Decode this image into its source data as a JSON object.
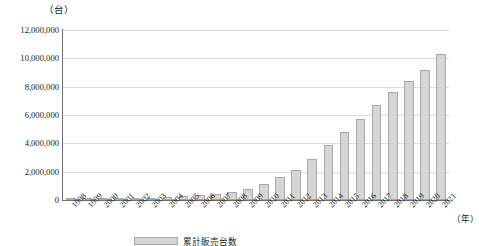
{
  "chart_data": {
    "type": "bar",
    "title": "",
    "subtitle": "",
    "unit_label": "（台）",
    "xlabel": "（年）",
    "ylabel": "",
    "ylim": [
      0,
      12000000
    ],
    "ytick_step": 2000000,
    "grid": true,
    "legend_position": "bottom",
    "categories": [
      "1998",
      "1999",
      "2000",
      "2001",
      "2002",
      "2003",
      "2004",
      "2005",
      "2006",
      "2007",
      "2008",
      "2009",
      "2010",
      "2011",
      "2012",
      "2013",
      "2014",
      "2015",
      "2016",
      "2017",
      "2018",
      "2019",
      "2020",
      "2021"
    ],
    "ytick_labels": [
      "0",
      "2,000,000",
      "4,000,000",
      "6,000,000",
      "8,000,000",
      "10,000,000",
      "12,000,000"
    ],
    "ytick_values": [
      0,
      2000000,
      4000000,
      6000000,
      8000000,
      10000000,
      12000000
    ],
    "series": [
      {
        "name": "累計販売台数",
        "color": "#d6d6d6",
        "values": [
          60000,
          70000,
          90000,
          110000,
          130000,
          160000,
          200000,
          260000,
          330000,
          420000,
          560000,
          780000,
          1100000,
          1600000,
          2100000,
          2900000,
          3900000,
          4800000,
          5700000,
          6700000,
          7600000,
          8400000,
          9200000,
          10300000
        ]
      }
    ],
    "legend": [
      {
        "label": "累計販売台数",
        "color": "#d6d6d6"
      }
    ]
  },
  "style": {
    "bar_fill": "#d6d6d6",
    "bar_border": "#a8a8a8",
    "grid_color": "#dcdcdc",
    "axis_color": "#6e6e6e",
    "text_color": "#1a1a1a",
    "background": "#ffffff"
  }
}
